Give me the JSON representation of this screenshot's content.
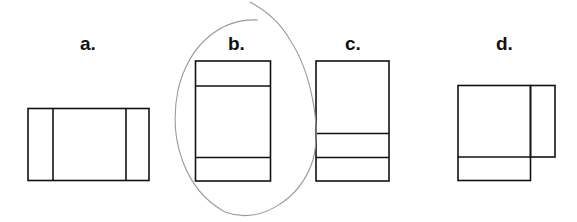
{
  "options": [
    {
      "id": "a",
      "label": "a."
    },
    {
      "id": "b",
      "label": "b."
    },
    {
      "id": "c",
      "label": "c."
    },
    {
      "id": "d",
      "label": "d."
    }
  ],
  "annotation": {
    "type": "hand-drawn circle",
    "circled_option": "b",
    "color": "#9a9a9a"
  },
  "colors": {
    "stroke": "#111111",
    "background": "#ffffff"
  }
}
